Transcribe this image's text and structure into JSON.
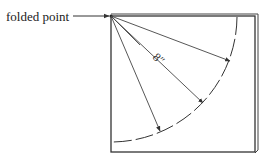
{
  "diagram": {
    "callout_label": "folded point",
    "dimension_label": "8″",
    "colors": {
      "line": "#333333",
      "background": "#ffffff"
    },
    "elements": {
      "square": "folded paper square",
      "arc": "dashed quarter-circle arc centered at folded point",
      "radii": "four arrows from folded point to arc"
    }
  }
}
